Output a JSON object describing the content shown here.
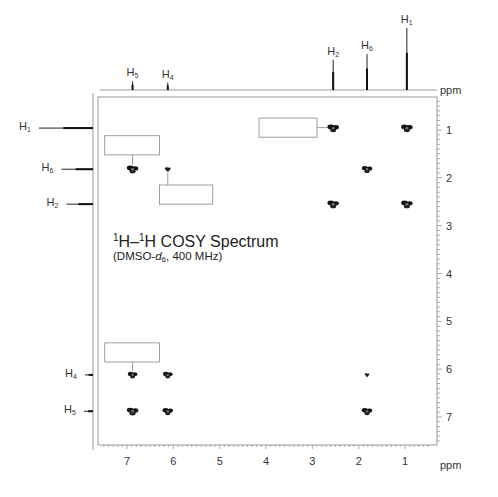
{
  "chart_data": {
    "type": "heatmap",
    "subtype": "2D NMR COSY contour plot",
    "title": "1H–1H COSY Spectrum",
    "subtitle": "(DMSO-d6, 400 MHz)",
    "xlabel": "ppm",
    "ylabel": "ppm",
    "xlim": [
      7.6,
      0.3
    ],
    "ylim": [
      0.3,
      7.6
    ],
    "x_ticks": [
      7,
      6,
      5,
      4,
      3,
      2,
      1
    ],
    "y_ticks": [
      1,
      2,
      3,
      4,
      5,
      6,
      7
    ],
    "axis_reversed": true,
    "grid": false,
    "projections": {
      "top": [
        {
          "label": "H5",
          "shift": 6.88,
          "intensity": 0.08
        },
        {
          "label": "H4",
          "shift": 6.12,
          "intensity": 0.06
        },
        {
          "label": "H2",
          "shift": 2.55,
          "intensity": 0.45
        },
        {
          "label": "H6",
          "shift": 1.82,
          "intensity": 0.55
        },
        {
          "label": "H1",
          "shift": 0.96,
          "intensity": 1.0
        }
      ],
      "left": [
        {
          "label": "H1",
          "shift": 0.96,
          "intensity": 1.0
        },
        {
          "label": "H6",
          "shift": 1.82,
          "intensity": 0.55
        },
        {
          "label": "H2",
          "shift": 2.55,
          "intensity": 0.45
        },
        {
          "label": "H4",
          "shift": 6.12,
          "intensity": 0.08
        },
        {
          "label": "H5",
          "shift": 6.88,
          "intensity": 0.1
        }
      ]
    },
    "cross_peaks": [
      {
        "x": 2.55,
        "y": 0.96,
        "size": 1.0
      },
      {
        "x": 0.96,
        "y": 0.96,
        "size": 1.0
      },
      {
        "x": 6.88,
        "y": 1.82,
        "size": 1.0
      },
      {
        "x": 6.12,
        "y": 1.82,
        "size": 0.4
      },
      {
        "x": 1.82,
        "y": 1.82,
        "size": 0.9
      },
      {
        "x": 2.55,
        "y": 2.55,
        "size": 1.0
      },
      {
        "x": 0.96,
        "y": 2.55,
        "size": 1.0
      },
      {
        "x": 6.88,
        "y": 6.12,
        "size": 0.8
      },
      {
        "x": 6.12,
        "y": 6.12,
        "size": 0.8
      },
      {
        "x": 1.82,
        "y": 6.12,
        "size": 0.3
      },
      {
        "x": 6.88,
        "y": 6.88,
        "size": 1.0
      },
      {
        "x": 6.12,
        "y": 6.88,
        "size": 0.9
      },
      {
        "x": 1.82,
        "y": 6.88,
        "size": 0.9
      }
    ],
    "annotation_boxes": [
      {
        "x0": 7.48,
        "x1": 6.3,
        "y0": 1.12,
        "y1": 1.52,
        "leader_to": {
          "x": 6.88,
          "y": 1.82
        }
      },
      {
        "x0": 6.3,
        "x1": 5.15,
        "y0": 2.15,
        "y1": 2.55,
        "leader_to": {
          "x": 6.12,
          "y": 1.82
        }
      },
      {
        "x0": 4.15,
        "x1": 2.9,
        "y0": 0.75,
        "y1": 1.15,
        "leader_to": {
          "x": 2.55,
          "y": 0.96
        }
      },
      {
        "x0": 7.48,
        "x1": 6.3,
        "y0": 5.45,
        "y1": 5.85,
        "leader_to": {
          "x": 6.88,
          "y": 6.12
        }
      }
    ]
  },
  "labels": {
    "title_main": "H–",
    "title_sup1": "1",
    "title_sup2": "1",
    "title_h": "H COSY Spectrum",
    "subtitle_a": "(DMSO-",
    "subtitle_d": "d",
    "subtitle_sub": "6",
    "subtitle_b": ", 400 MHz)",
    "x_unit": "ppm",
    "y_unit": "ppm"
  }
}
